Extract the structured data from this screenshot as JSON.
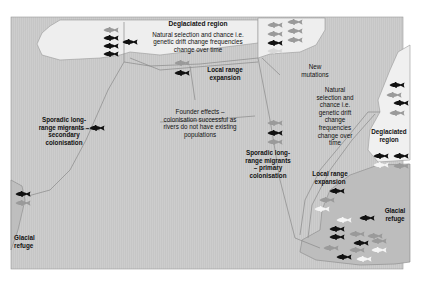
{
  "diagram": {
    "colors": {
      "sea": "#c9c9c9",
      "deglaciated": "#efefef",
      "refuge_land": "#b8b8b8",
      "river": "#8a8a8a",
      "fish_black": "#111111",
      "fish_grey": "#9a9a9a",
      "fish_white": "#f5f5f5"
    },
    "labels": {
      "deglaciated_top": {
        "title": "Deglaciated region",
        "lines": [
          "Natural selection and chance i.e.",
          "genetic drift change frequencies",
          "change over time"
        ]
      },
      "new_mutations": {
        "lines": [
          "New",
          "mutations"
        ]
      },
      "local_range_top": {
        "lines": [
          "Local range",
          "expansion"
        ]
      },
      "founder_effects": {
        "lines": [
          "Founder effects –",
          "colonisation successful as",
          "rivers do not have existing",
          "populations"
        ]
      },
      "sporadic_secondary": {
        "lines": [
          "Sporadic long-",
          "range migrants –",
          "secondary",
          "colonisation"
        ]
      },
      "natural_selection_right": {
        "lines": [
          "Natural",
          "selection and",
          "chance i.e.",
          "genetic drift",
          "change",
          "frequencies",
          "change over",
          "time"
        ]
      },
      "deglaciated_right": {
        "lines": [
          "Deglaciated",
          "region"
        ]
      },
      "sporadic_primary": {
        "lines": [
          "Sporadic long-",
          "range migrants",
          "– primary",
          "colonisation"
        ]
      },
      "local_range_right": {
        "lines": [
          "Local range",
          "expansion"
        ]
      },
      "glacial_refuge_right": {
        "lines": [
          "Glacial",
          "refuge"
        ]
      },
      "glacial_refuge_left": {
        "lines": [
          "Glacial",
          "refuge"
        ]
      }
    }
  }
}
